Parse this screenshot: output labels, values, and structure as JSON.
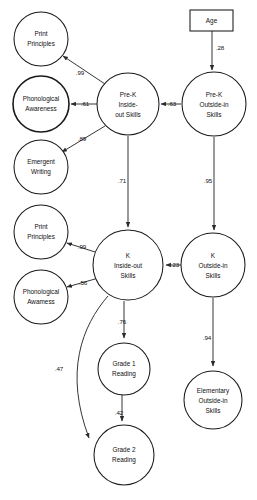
{
  "diagram": {
    "type": "path-diagram",
    "nodes": [
      {
        "id": "print_principles_prek",
        "label_line1": "Print",
        "label_line2": "Principles",
        "shape": "circle",
        "cx": 41,
        "cy": 39,
        "r": 27,
        "emphasis": "normal"
      },
      {
        "id": "phonological_awareness_prek",
        "label_line1": "Phonological",
        "label_line2": "Awareness",
        "shape": "circle",
        "cx": 41,
        "cy": 104,
        "r": 28,
        "emphasis": "bold"
      },
      {
        "id": "emergent_writing",
        "label_line1": "Emergent",
        "label_line2": "Writing",
        "shape": "circle",
        "cx": 41,
        "cy": 167,
        "r": 27,
        "emphasis": "normal"
      },
      {
        "id": "print_principles_k",
        "label_line1": "Print",
        "label_line2": "Principles",
        "shape": "circle",
        "cx": 41,
        "cy": 232,
        "r": 27,
        "emphasis": "normal"
      },
      {
        "id": "phonological_awareness_k",
        "label_line1": "Phonological",
        "label_line2": "Awamess",
        "shape": "circle",
        "cx": 41,
        "cy": 297,
        "r": 27,
        "emphasis": "normal"
      },
      {
        "id": "prek_inside_out",
        "label_line1": "Pre-K",
        "label_line2": "Inside-",
        "label_line3": "out Skills",
        "shape": "circle",
        "cx": 128,
        "cy": 104,
        "r": 31,
        "emphasis": "normal"
      },
      {
        "id": "k_inside_out",
        "label_line1": "K",
        "label_line2": "Inside-out",
        "label_line3": "Skills",
        "shape": "circle",
        "cx": 128,
        "cy": 265,
        "r": 35,
        "emphasis": "normal"
      },
      {
        "id": "grade1_reading",
        "label_line1": "Grade 1",
        "label_line2": "Reading",
        "shape": "circle",
        "cx": 124,
        "cy": 369,
        "r": 26,
        "emphasis": "normal"
      },
      {
        "id": "grade2_reading",
        "label_line1": "Grade 2",
        "label_line2": "Reading",
        "shape": "circle",
        "cx": 124,
        "cy": 455,
        "r": 30,
        "emphasis": "normal"
      },
      {
        "id": "age",
        "label_line1": "Age",
        "shape": "rect",
        "x": 190,
        "y": 10,
        "w": 43,
        "h": 21,
        "emphasis": "normal"
      },
      {
        "id": "prek_outside_in",
        "label_line1": "Pre-K",
        "label_line2": "Outside-in",
        "label_line3": "Skills",
        "shape": "circle",
        "cx": 214,
        "cy": 104,
        "r": 32,
        "emphasis": "normal"
      },
      {
        "id": "k_outside_in",
        "label_line1": "K",
        "label_line2": "Outside-in",
        "label_line3": "Skills",
        "shape": "circle",
        "cx": 213,
        "cy": 265,
        "r": 32,
        "emphasis": "normal"
      },
      {
        "id": "elementary_outside_in",
        "label_line1": "Elementary",
        "label_line2": "Outside-in",
        "label_line3": "Skills",
        "shape": "circle",
        "cx": 213,
        "cy": 400,
        "r": 29,
        "emphasis": "normal"
      }
    ],
    "paths": [
      {
        "id": "age_to_prek_outside",
        "from": "age",
        "to": "prek_outside_in",
        "coefficient": ".28",
        "label_x": 220,
        "label_y": 48
      },
      {
        "id": "prek_outside_to_prek_inside",
        "from": "prek_outside_in",
        "to": "prek_inside_out",
        "coefficient": ".63",
        "label_x": 172,
        "label_y": 104
      },
      {
        "id": "prek_inside_to_print_principles",
        "from": "prek_inside_out",
        "to": "print_principles_prek",
        "coefficient": ".99",
        "label_x": 80,
        "label_y": 73
      },
      {
        "id": "prek_inside_to_phonological",
        "from": "prek_inside_out",
        "to": "phonological_awareness_prek",
        "coefficient": ".61",
        "label_x": 85,
        "label_y": 104
      },
      {
        "id": "prek_inside_to_emergent_writing",
        "from": "prek_inside_out",
        "to": "emergent_writing",
        "coefficient": ".89",
        "label_x": 82,
        "label_y": 139
      },
      {
        "id": "prek_inside_to_k_inside",
        "from": "prek_inside_out",
        "to": "k_inside_out",
        "coefficient": ".71",
        "label_x": 122,
        "label_y": 181
      },
      {
        "id": "prek_outside_to_k_outside",
        "from": "prek_outside_in",
        "to": "k_outside_in",
        "coefficient": ".95",
        "label_x": 208,
        "label_y": 181
      },
      {
        "id": "k_outside_to_k_inside",
        "from": "k_outside_in",
        "to": "k_inside_out",
        "coefficient": ".23",
        "label_x": 175,
        "label_y": 265
      },
      {
        "id": "k_inside_to_print_principles",
        "from": "k_inside_out",
        "to": "print_principles_k",
        "coefficient": ".99",
        "label_x": 82,
        "label_y": 247
      },
      {
        "id": "k_inside_to_phonological",
        "from": "k_inside_out",
        "to": "phonological_awareness_k",
        "coefficient": ".56",
        "label_x": 83,
        "label_y": 283
      },
      {
        "id": "k_inside_to_grade1",
        "from": "k_inside_out",
        "to": "grade1_reading",
        "coefficient": ".76",
        "label_x": 122,
        "label_y": 322
      },
      {
        "id": "grade1_to_grade2",
        "from": "grade1_reading",
        "to": "grade2_reading",
        "coefficient": ".42",
        "label_x": 119,
        "label_y": 413
      },
      {
        "id": "k_inside_to_grade2",
        "from": "k_inside_out",
        "to": "grade2_reading",
        "coefficient": ".47",
        "label_x": 59,
        "label_y": 369
      },
      {
        "id": "k_outside_to_elementary",
        "from": "k_outside_in",
        "to": "elementary_outside_in",
        "coefficient": ".94",
        "label_x": 207,
        "label_y": 338
      }
    ]
  },
  "colors": {
    "stroke": "#1a1a1a",
    "background": "#ffffff",
    "text": "#111111"
  }
}
